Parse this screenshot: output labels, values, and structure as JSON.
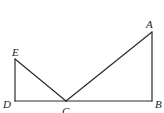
{
  "figure": {
    "type": "geometry",
    "points": {
      "A": {
        "label": "A",
        "x": 152,
        "y": 32
      },
      "B": {
        "label": "B",
        "x": 152,
        "y": 101
      },
      "C": {
        "label": "C",
        "x": 66,
        "y": 101
      },
      "D": {
        "label": "D",
        "x": 15,
        "y": 101
      },
      "E": {
        "label": "E",
        "x": 15,
        "y": 59
      }
    },
    "segments": [
      [
        "D",
        "E"
      ],
      [
        "E",
        "C"
      ],
      [
        "C",
        "A"
      ],
      [
        "A",
        "B"
      ],
      [
        "D",
        "B"
      ]
    ],
    "labels": {
      "A": "A",
      "B": "B",
      "C": "C",
      "D": "D",
      "E": "E"
    },
    "colors": {
      "line": "#2a2a2a",
      "text": "#222222",
      "background": "#ffffff"
    }
  }
}
